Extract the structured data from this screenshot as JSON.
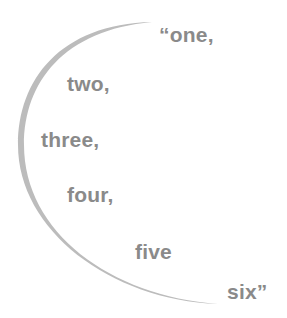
{
  "figure": {
    "words": [
      {
        "text": "“one,"
      },
      {
        "text": "two,"
      },
      {
        "text": "three,"
      },
      {
        "text": "four,"
      },
      {
        "text": "five"
      },
      {
        "text": "six”"
      }
    ],
    "text_color": "#8a8a8a",
    "arc_color": "#bcbcbc",
    "background": "#ffffff"
  }
}
